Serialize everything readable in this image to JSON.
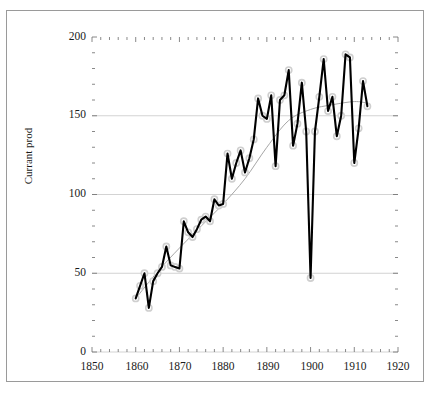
{
  "chart_data": {
    "type": "line",
    "title": "",
    "xlabel": "",
    "ylabel": "Currant prod",
    "xlim": [
      1850,
      1920
    ],
    "ylim": [
      0,
      200
    ],
    "xticks": [
      1850,
      1860,
      1870,
      1880,
      1890,
      1900,
      1910,
      1920
    ],
    "yticks": [
      0,
      50,
      100,
      150,
      200
    ],
    "x_minor_tick_step": 2,
    "y_minor_tick_step": 10,
    "grid": "horizontal",
    "legend": "none",
    "series": [
      {
        "name": "Currant prod",
        "marker": "open-circle",
        "color": "#000000",
        "x": [
          1860,
          1861,
          1862,
          1863,
          1864,
          1865,
          1866,
          1867,
          1868,
          1869,
          1870,
          1871,
          1872,
          1873,
          1874,
          1875,
          1876,
          1877,
          1878,
          1879,
          1880,
          1881,
          1882,
          1883,
          1884,
          1885,
          1886,
          1887,
          1888,
          1889,
          1890,
          1891,
          1892,
          1893,
          1894,
          1895,
          1896,
          1897,
          1898,
          1899,
          1900,
          1901,
          1902,
          1903,
          1904,
          1905,
          1906,
          1907,
          1908,
          1909,
          1910,
          1911,
          1912,
          1913
        ],
        "values": [
          34,
          42,
          50,
          28,
          45,
          50,
          54,
          67,
          55,
          54,
          53,
          83,
          76,
          73,
          78,
          84,
          86,
          83,
          97,
          93,
          94,
          126,
          110,
          120,
          128,
          114,
          123,
          135,
          161,
          150,
          148,
          163,
          118,
          160,
          163,
          179,
          131,
          145,
          171,
          140,
          47,
          140,
          162,
          186,
          153,
          162,
          137,
          150,
          189,
          187,
          120,
          142,
          172,
          156
        ]
      },
      {
        "name": "trend",
        "marker": "none",
        "color": "#a6a6a6",
        "x": [
          1860,
          1865,
          1870,
          1875,
          1880,
          1885,
          1890,
          1895,
          1900,
          1905,
          1910,
          1913
        ],
        "values": [
          34,
          51,
          66,
          80,
          94,
          110,
          130,
          147,
          154,
          157,
          159,
          158
        ]
      }
    ]
  },
  "axis": {
    "y_label": "Currant prod",
    "y_tick_labels": [
      "200",
      "150",
      "100",
      "50",
      "0"
    ],
    "x_tick_labels": [
      "1850",
      "1860",
      "1870",
      "1880",
      "1890",
      "1900",
      "1910",
      "1920"
    ]
  },
  "colors": {
    "series_line": "#000000",
    "trend_line": "#a6a6a6",
    "gridline": "#c8c8c8",
    "axis": "#6b6b6b",
    "frame": "#9a9a9a",
    "marker_edge": "#cfcfcf",
    "text": "#1a1a1a"
  }
}
